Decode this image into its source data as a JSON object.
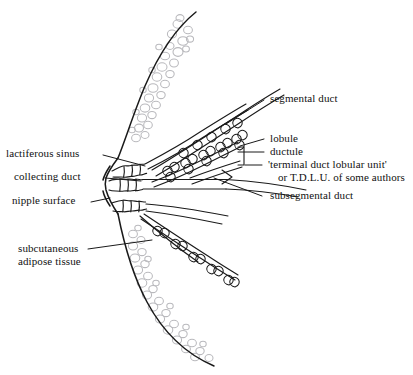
{
  "figure": {
    "background_color": "#ffffff",
    "ink_color": "#1a1a1a",
    "fat_color": "#b9b9bd",
    "leader_color": "#1a1a1a"
  },
  "labels": {
    "lactiferous_sinus": "lactiferous sinus",
    "collecting_duct": "collecting duct",
    "nipple_surface": "nipple surface",
    "subcutaneous_adipose_tissue_line1": "subcutaneous",
    "subcutaneous_adipose_tissue_line2": "adipose tissue",
    "segmental_duct": "segmental duct",
    "lobule": "lobule",
    "ductule": "ductule",
    "tdlu_line1": "'terminal duct lobular unit'",
    "tdlu_line2": "or T.D.L.U. of some authors",
    "subsegmental_duct": "subsegmental duct"
  },
  "structures": [
    {
      "name": "breast-outline",
      "description": "breast profile curve, convex left nipple, sweeping to upper right and lower right"
    },
    {
      "name": "nipple",
      "description": "central protruding nipple surface at left of duct convergence"
    },
    {
      "name": "lactiferous-sinus",
      "description": "dilated wavy duct segments just behind the nipple"
    },
    {
      "name": "collecting-duct",
      "description": "duct running from sinus into the breast"
    },
    {
      "name": "segmental-duct",
      "description": "large duct branching upward and to the right"
    },
    {
      "name": "subsegmental-duct",
      "description": "smaller ducts branching from segmental ducts"
    },
    {
      "name": "ductule",
      "description": "fine terminal ducts bearing lobules"
    },
    {
      "name": "lobule",
      "description": "clusters of small looped acini along ductules"
    },
    {
      "name": "terminal-duct-lobular-unit",
      "description": "bracketed ductule plus its lobule"
    },
    {
      "name": "subcutaneous-adipose-tissue",
      "description": "stippled bubble texture of fat cells beneath the skin outline"
    }
  ]
}
